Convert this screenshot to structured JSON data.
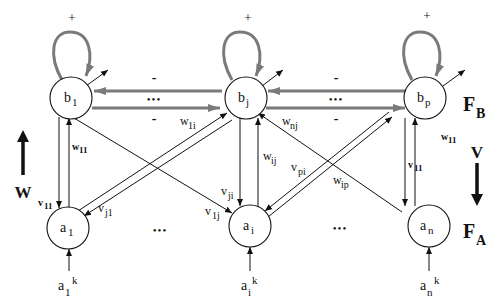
{
  "diagram": {
    "type": "bidirectional-associative-memory network",
    "layers": {
      "top": {
        "label": "F",
        "sub": "B"
      },
      "bottom": {
        "label": "F",
        "sub": "A"
      }
    },
    "direction_labels": {
      "up": "W",
      "down": "V"
    },
    "top_nodes": [
      {
        "base": "b",
        "sub": "1"
      },
      {
        "base": "b",
        "sub": "j"
      },
      {
        "base": "b",
        "sub": "p"
      }
    ],
    "bottom_nodes": [
      {
        "base": "a",
        "sub": "1"
      },
      {
        "base": "a",
        "sub": "i"
      },
      {
        "base": "a",
        "sub": "n"
      }
    ],
    "inputs": [
      {
        "base": "a",
        "sub": "1",
        "sup": "k"
      },
      {
        "base": "a",
        "sub": "i",
        "sup": "k"
      },
      {
        "base": "a",
        "sub": "n",
        "sup": "k"
      }
    ],
    "self_loop_sign": "+",
    "lateral_sign": "-",
    "ellipsis": "•••",
    "weights": {
      "w11_left": {
        "base": "w",
        "sub": "11"
      },
      "v11_left": {
        "base": "v",
        "sub": "11"
      },
      "vj1": {
        "base": "v",
        "sub": "j1"
      },
      "w1i": {
        "base": "w",
        "sub": "1i"
      },
      "wnj": {
        "base": "w",
        "sub": "nj"
      },
      "wij": {
        "base": "w",
        "sub": "ij"
      },
      "vji": {
        "base": "v",
        "sub": "ji"
      },
      "v1j": {
        "base": "v",
        "sub": "1j"
      },
      "vpi": {
        "base": "v",
        "sub": "pi"
      },
      "wip": {
        "base": "w",
        "sub": "ip"
      },
      "w11_right": {
        "base": "w",
        "sub": "11"
      },
      "v11_right": {
        "base": "v",
        "sub": "11"
      }
    },
    "colors": {
      "line": "#111111",
      "lateral": "#7a7a7a",
      "background": "#ffffff"
    }
  }
}
